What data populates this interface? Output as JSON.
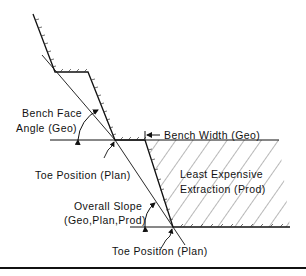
{
  "diagram": {
    "labels": {
      "bench_face_angle_line1": "Bench Face",
      "bench_face_angle_line2": "Angle (Geo)",
      "bench_width": "Bench Width (Geo)",
      "toe_position_upper": "Toe Position (Plan)",
      "least_expensive_line1": "Least Expensive",
      "least_expensive_line2": "Extraction (Prod)",
      "overall_slope_line1": "Overall Slope",
      "overall_slope_line2": "(Geo,Plan,Prod)",
      "toe_position_lower": "Toe Position (Plan)"
    },
    "colors": {
      "line": "#1a1a1a",
      "background": "#ffffff"
    }
  }
}
